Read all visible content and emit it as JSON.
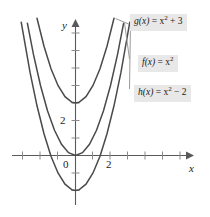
{
  "chart_data": {
    "type": "line",
    "title": "",
    "xlabel": "x",
    "ylabel": "y",
    "xlim": [
      -3.6,
      4.2
    ],
    "ylim": [
      -3.5,
      7.8
    ],
    "grid": false,
    "legend_position": "right-inline-labels",
    "x_tick_labels": [
      "0",
      "2"
    ],
    "y_tick_labels": [
      "0",
      "2"
    ],
    "x_ticks_major_labeled": [
      0,
      2
    ],
    "y_ticks_major_labeled": [
      0,
      2
    ],
    "tick_spacing_units": 1,
    "series": [
      {
        "name": "g(x) = x² + 3",
        "equation": "x^2 + 3",
        "vertex": [
          0,
          3
        ],
        "x": [
          -2.2,
          -1.8,
          -1.4,
          -1.0,
          -0.6,
          -0.2,
          0,
          0.2,
          0.6,
          1.0,
          1.4,
          1.8,
          2.2
        ],
        "y": [
          7.84,
          6.24,
          4.96,
          4.0,
          3.36,
          3.04,
          3.0,
          3.04,
          3.36,
          4.0,
          4.96,
          6.24,
          7.84
        ]
      },
      {
        "name": "f(x) = x²",
        "equation": "x^2",
        "vertex": [
          0,
          0
        ],
        "x": [
          -2.75,
          -2.4,
          -2.0,
          -1.6,
          -1.2,
          -0.8,
          -0.4,
          0,
          0.4,
          0.8,
          1.2,
          1.6,
          2.0,
          2.4,
          2.75
        ],
        "y": [
          7.5625,
          5.76,
          4.0,
          2.56,
          1.44,
          0.64,
          0.16,
          0,
          0.16,
          0.64,
          1.44,
          2.56,
          4.0,
          5.76,
          7.5625
        ]
      },
      {
        "name": "h(x) = x² − 2",
        "equation": "x^2 - 2",
        "vertex": [
          0,
          -2
        ],
        "roots": [
          -1.4142,
          1.4142
        ],
        "x": [
          -3.1,
          -2.6,
          -2.2,
          -1.8,
          -1.4,
          -1.0,
          -0.6,
          -0.2,
          0,
          0.2,
          0.6,
          1.0,
          1.4,
          1.8,
          2.2,
          2.6,
          3.1
        ],
        "y": [
          7.61,
          4.76,
          2.84,
          1.24,
          -0.04,
          -1.0,
          -1.64,
          -1.96,
          -2.0,
          -1.96,
          -1.64,
          -1.0,
          -0.04,
          1.24,
          2.84,
          4.76,
          7.61
        ]
      }
    ]
  },
  "axes": {
    "y_axis_label": "y",
    "x_axis_label": "x",
    "origin_label": "0",
    "x_tick_2": "2",
    "y_tick_2": "2"
  },
  "labels": {
    "g": {
      "fn": "g(x)",
      "eq_lead": " = x",
      "exp": "2",
      "eq_tail": " + 3"
    },
    "f": {
      "fn": "f(x)",
      "eq_lead": " = x",
      "exp": "2",
      "eq_tail": ""
    },
    "h": {
      "fn": "h(x)",
      "eq_lead": " = x",
      "exp": "2",
      "eq_tail": " − 2"
    }
  },
  "colors": {
    "curve": "#4a4a4c",
    "axis": "#59595b",
    "tick": "#8a8a8c",
    "label_bg": "#e8e8e8",
    "text": "#1a1a1a",
    "background": "#ffffff"
  }
}
